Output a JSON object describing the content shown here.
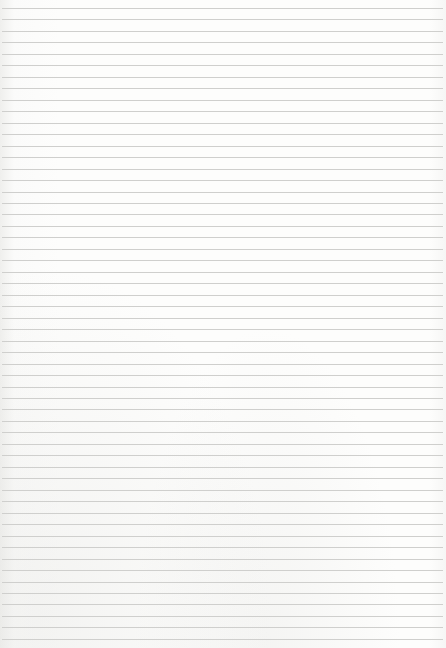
{
  "page": {
    "type": "lined-paper",
    "background_color": "#fbfbfa",
    "line_color": "#cfcfcd",
    "line_count": 56,
    "first_line_y": 8,
    "line_spacing": 11.47
  }
}
